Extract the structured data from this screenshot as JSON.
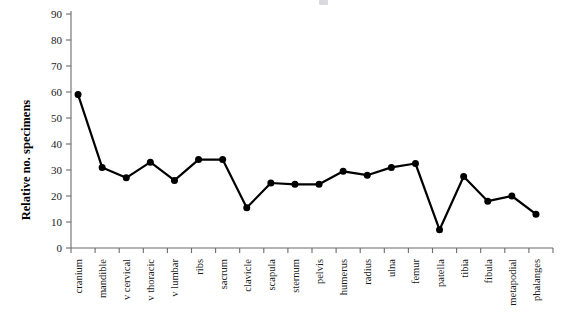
{
  "chart_data": {
    "type": "line",
    "title": "",
    "xlabel": "",
    "ylabel": "Relative no. specimens",
    "ylim": [
      0,
      90
    ],
    "ytick_step": 10,
    "yticks": [
      0,
      10,
      20,
      30,
      40,
      50,
      60,
      70,
      80,
      90
    ],
    "grid": false,
    "legend": null,
    "marker": "filled-circle",
    "line_color": "#000000",
    "marker_color": "#000000",
    "axis_color": "#6b6b6b",
    "categories": [
      "cranium",
      "mandible",
      "v cervical",
      "v thoracic",
      "v lumbar",
      "ribs",
      "sacrum",
      "clavicle",
      "scapula",
      "sternum",
      "pelvis",
      "humerus",
      "radius",
      "ulna",
      "femur",
      "patella",
      "tibia",
      "fibula",
      "metapodial",
      "phalanges"
    ],
    "values": [
      59,
      31,
      27,
      33,
      26,
      34,
      34,
      15.5,
      25,
      24.5,
      24.5,
      29.5,
      28,
      31,
      32.5,
      7,
      27.5,
      18,
      20,
      13
    ],
    "series": [
      {
        "name": "Relative no. specimens",
        "values": [
          59,
          31,
          27,
          33,
          26,
          34,
          34,
          15.5,
          25,
          24.5,
          24.5,
          29.5,
          28,
          31,
          32.5,
          7,
          27.5,
          18,
          20,
          13
        ]
      }
    ]
  }
}
